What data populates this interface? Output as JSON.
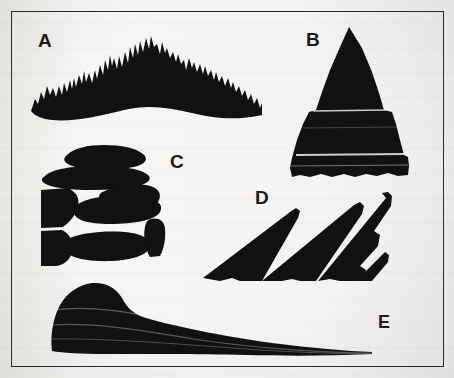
{
  "figure": {
    "background_color": "#f4f3f1",
    "ink_color": "#111111",
    "border_color": "#2b2b2b",
    "border": {
      "x": 11,
      "y": 11,
      "width": 433,
      "height": 356
    }
  },
  "labels": {
    "a": "A",
    "b": "B",
    "c": "C",
    "d": "D",
    "e": "E"
  },
  "shapes": [
    {
      "id": "a",
      "label": "A",
      "name": "jagged-peaks-ridge",
      "description": "Wide ridge silhouette with many sharp sawtooth spires along the crest and a gently curved concave base",
      "label_position": {
        "x": 38,
        "y": 31
      },
      "bounds": {
        "x": 30,
        "y": 30,
        "width": 232,
        "height": 90
      }
    },
    {
      "id": "b",
      "label": "B",
      "name": "pyramidal-peak",
      "description": "Steep symmetrical pyramid or cone shaped peak with faint horizontal strata bands and a ragged base",
      "label_position": {
        "x": 306,
        "y": 30
      },
      "bounds": {
        "x": 288,
        "y": 26,
        "width": 122,
        "height": 153
      }
    },
    {
      "id": "c",
      "label": "C",
      "name": "stacked-blocky-mesa",
      "description": "Stacked blocky horizontal layers separated by thin white joints, resembling a flat-topped eroded butte",
      "label_position": {
        "x": 170,
        "y": 152
      },
      "bounds": {
        "x": 38,
        "y": 142,
        "width": 128,
        "height": 128
      }
    },
    {
      "id": "d",
      "label": "D",
      "name": "tilted-cuesta-wedges",
      "description": "Three overlapping tilted wedge shaped blocks with diagonal white partings dipping to the left",
      "label_position": {
        "x": 255,
        "y": 188
      },
      "bounds": {
        "x": 202,
        "y": 192,
        "width": 190,
        "height": 92
      }
    },
    {
      "id": "e",
      "label": "E",
      "name": "asymmetric-tapering-ridge",
      "description": "Long asymmetric ridge with a rounded high shoulder at the left tapering to a thin point at the right, with faint horizontal bedding lines",
      "label_position": {
        "x": 378,
        "y": 313
      },
      "bounds": {
        "x": 48,
        "y": 283,
        "width": 325,
        "height": 72
      }
    }
  ],
  "counts": {
    "shape_count": 5,
    "label_list": "A, B, C, D, E"
  }
}
